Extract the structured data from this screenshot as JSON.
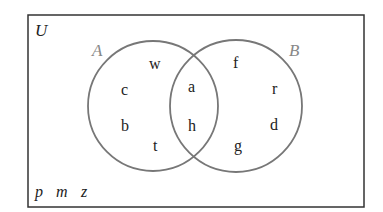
{
  "diagram": {
    "universe_label": "U",
    "sets": [
      {
        "label": "A",
        "color": "#888888"
      },
      {
        "label": "B",
        "color": "#888888"
      }
    ],
    "regions": {
      "A_only": [
        "w",
        "c",
        "b",
        "t"
      ],
      "A_and_B": [
        "a",
        "h"
      ],
      "B_only": [
        "f",
        "r",
        "d",
        "g"
      ],
      "outside": [
        "p",
        "m",
        "z"
      ]
    },
    "outside_text": [
      "p",
      "m",
      "z"
    ],
    "colors": {
      "border": "#333333",
      "circle": "#777777",
      "text": "#222222"
    }
  }
}
